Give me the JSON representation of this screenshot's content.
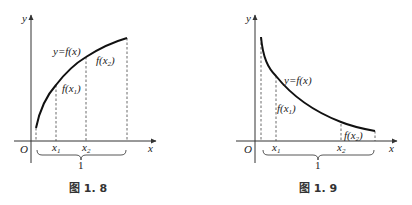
{
  "figures": [
    {
      "id": "fig-1-8",
      "caption": "图 1. 8",
      "axis_labels": {
        "x": "x",
        "y": "y",
        "origin": "O"
      },
      "curve_label": "y=f(x)",
      "value_labels": {
        "f1": "f(x",
        "f1_sub": "1",
        "f2": "f(x",
        "f2_sub": "2",
        "close": ")"
      },
      "tick_labels": {
        "x1": "x",
        "x1_sub": "1",
        "x2": "x",
        "x2_sub": "2"
      },
      "interval_label": "1",
      "curve_type": "increasing concave"
    },
    {
      "id": "fig-1-9",
      "caption": "图 1. 9",
      "axis_labels": {
        "x": "x",
        "y": "y",
        "origin": "O"
      },
      "curve_label": "y=f(x)",
      "value_labels": {
        "f1": "f(x",
        "f1_sub": "1",
        "f2": "f(x",
        "f2_sub": "2",
        "close": ")"
      },
      "tick_labels": {
        "x1": "x",
        "x1_sub": "1",
        "x2": "x",
        "x2_sub": "2"
      },
      "interval_label": "1",
      "curve_type": "decreasing convex"
    }
  ]
}
